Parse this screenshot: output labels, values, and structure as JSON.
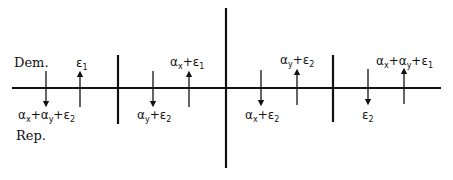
{
  "diagram": {
    "party_labels": {
      "top": "Dem.",
      "bottom": "Rep."
    },
    "colors": {
      "line": "#111111",
      "background": "#ffffff"
    },
    "axis": {
      "y": 88,
      "x_start": 12,
      "x_end": 441
    },
    "center_divider": {
      "x": 226,
      "y_top": 8,
      "y_bottom": 168
    },
    "dividers": [
      {
        "x": 118,
        "y_top": 55,
        "y_bottom": 124
      },
      {
        "x": 333,
        "y_top": 55,
        "y_bottom": 122
      }
    ],
    "panels": [
      {
        "down": {
          "x": 46,
          "label_parts": [
            "α",
            "x",
            "+α",
            "y",
            "+ε",
            "2"
          ]
        },
        "up": {
          "x": 80,
          "label_parts": [
            "ε",
            "1"
          ]
        },
        "down_label": "αx+αy+ε2",
        "up_label": "ε1"
      },
      {
        "down": {
          "x": 153
        },
        "up": {
          "x": 189
        },
        "down_label": "αy+ε2",
        "up_label": "αx+ε1"
      },
      {
        "down": {
          "x": 261
        },
        "up": {
          "x": 297
        },
        "down_label": "αx+ε2",
        "up_label": "αy+ε2"
      },
      {
        "down": {
          "x": 368
        },
        "up": {
          "x": 404
        },
        "down_label": "ε2",
        "up_label": "αx+αy+ε1"
      }
    ],
    "labels": {
      "p1_down": {
        "a": "α",
        "as": "x",
        "b": "+α",
        "bs": "y",
        "c": "+ε",
        "cs": "2"
      },
      "p1_up": {
        "a": "ε",
        "as": "1"
      },
      "p2_down": {
        "a": "α",
        "as": "y",
        "b": "+ε",
        "bs": "2"
      },
      "p2_up": {
        "a": "α",
        "as": "x",
        "b": "+ε",
        "bs": "1"
      },
      "p3_down": {
        "a": "α",
        "as": "x",
        "b": "+ε",
        "bs": "2"
      },
      "p3_up": {
        "a": "α",
        "as": "y",
        "b": "+ε",
        "bs": "2"
      },
      "p4_down": {
        "a": "ε",
        "as": "2"
      },
      "p4_up": {
        "a": "α",
        "as": "x",
        "b": "+α",
        "bs": "y",
        "c": "+ε",
        "cs": "1"
      }
    }
  }
}
